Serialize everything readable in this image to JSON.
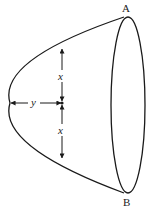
{
  "diagram": {
    "labels": {
      "top_point": "A",
      "bottom_point": "B",
      "horizontal_distance": "y",
      "upper_vertical_distance": "x",
      "lower_vertical_distance": "x"
    },
    "colors": {
      "stroke": "#1a1a1a",
      "background": "#ffffff"
    }
  }
}
